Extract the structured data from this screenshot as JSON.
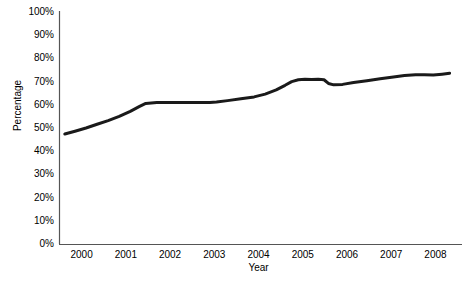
{
  "chart_data": {
    "type": "line",
    "title": "",
    "xlabel": "Year",
    "ylabel": "Percentage",
    "xlim": [
      1999.5,
      2008.6
    ],
    "ylim": [
      0,
      100
    ],
    "grid": false,
    "legend": null,
    "legend_position": "none",
    "line_color": "#1a1a1a",
    "line_width_px": 3,
    "background_color": "#ffffff",
    "axis_color": "#555555",
    "y_ticks": [
      {
        "value": 0,
        "label": "0%"
      },
      {
        "value": 10,
        "label": "10%"
      },
      {
        "value": 20,
        "label": "20%"
      },
      {
        "value": 30,
        "label": "30%"
      },
      {
        "value": 40,
        "label": "40%"
      },
      {
        "value": 50,
        "label": "50%"
      },
      {
        "value": 60,
        "label": "60%"
      },
      {
        "value": 70,
        "label": "70%"
      },
      {
        "value": 80,
        "label": "80%"
      },
      {
        "value": 90,
        "label": "90%"
      },
      {
        "value": 100,
        "label": "100%"
      }
    ],
    "x_ticks": [
      {
        "value": 2000,
        "label": "2000"
      },
      {
        "value": 2001,
        "label": "2001"
      },
      {
        "value": 2002,
        "label": "2002"
      },
      {
        "value": 2003,
        "label": "2003"
      },
      {
        "value": 2004,
        "label": "2004"
      },
      {
        "value": 2005,
        "label": "2005"
      },
      {
        "value": 2006,
        "label": "2006"
      },
      {
        "value": 2007,
        "label": "2007"
      },
      {
        "value": 2008,
        "label": "2008"
      }
    ],
    "series": [
      {
        "name": "Percentage",
        "x": [
          1999.62,
          1999.85,
          2000.1,
          2000.35,
          2000.6,
          2000.85,
          2001.1,
          2001.3,
          2001.45,
          2001.7,
          2002.0,
          2002.3,
          2002.6,
          2002.9,
          2003.05,
          2003.3,
          2003.6,
          2003.9,
          2004.15,
          2004.4,
          2004.6,
          2004.75,
          2004.9,
          2005.05,
          2005.2,
          2005.35,
          2005.48,
          2005.58,
          2005.7,
          2005.9,
          2006.15,
          2006.45,
          2006.75,
          2007.05,
          2007.3,
          2007.55,
          2007.75,
          2007.95,
          2008.15,
          2008.32
        ],
        "y": [
          47.4,
          48.6,
          50.0,
          51.6,
          53.2,
          55.0,
          57.2,
          59.2,
          60.6,
          61.0,
          61.0,
          61.0,
          61.0,
          61.0,
          61.2,
          61.8,
          62.6,
          63.4,
          64.6,
          66.4,
          68.4,
          70.0,
          70.8,
          71.0,
          70.9,
          71.0,
          70.8,
          69.2,
          68.6,
          68.8,
          69.6,
          70.4,
          71.2,
          72.0,
          72.6,
          73.0,
          72.9,
          72.8,
          73.2,
          73.6
        ]
      }
    ]
  }
}
